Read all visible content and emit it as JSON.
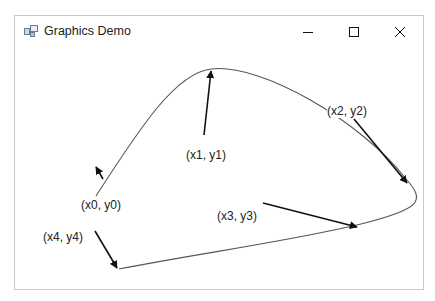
{
  "window": {
    "title": "Graphics Demo",
    "icon": "app-window-icon",
    "controls": {
      "minimize": "minimize-icon",
      "maximize": "maximize-icon",
      "close": "close-icon"
    }
  },
  "canvas": {
    "curve_color": "#555555",
    "arrow_color": "#111111",
    "labels": {
      "p0": "(x0, y0)",
      "p1": "(x1, y1)",
      "p2": "(x2, y2)",
      "p3": "(x3, y3)",
      "p4": "(x4, y4)"
    }
  }
}
